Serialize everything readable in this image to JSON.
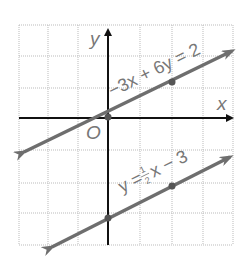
{
  "diagram": {
    "type": "coordinate-grid",
    "axes": {
      "x_label": "x",
      "y_label": "y",
      "origin_label": "O"
    },
    "grid": {
      "x_range": [
        -3,
        4
      ],
      "y_range": [
        -4,
        3
      ],
      "step": 1
    },
    "lines": [
      {
        "equation": "−3x + 6y = 2",
        "points": [
          [
            0,
            0.333
          ],
          [
            2,
            1.333
          ]
        ],
        "color": "#6e6e6e"
      },
      {
        "equation_parts": {
          "left": "y =",
          "num": "1",
          "den": "2",
          "right": "x − 3"
        },
        "points": [
          [
            0,
            -3
          ],
          [
            2,
            -2
          ]
        ],
        "color": "#6e6e6e"
      }
    ]
  }
}
